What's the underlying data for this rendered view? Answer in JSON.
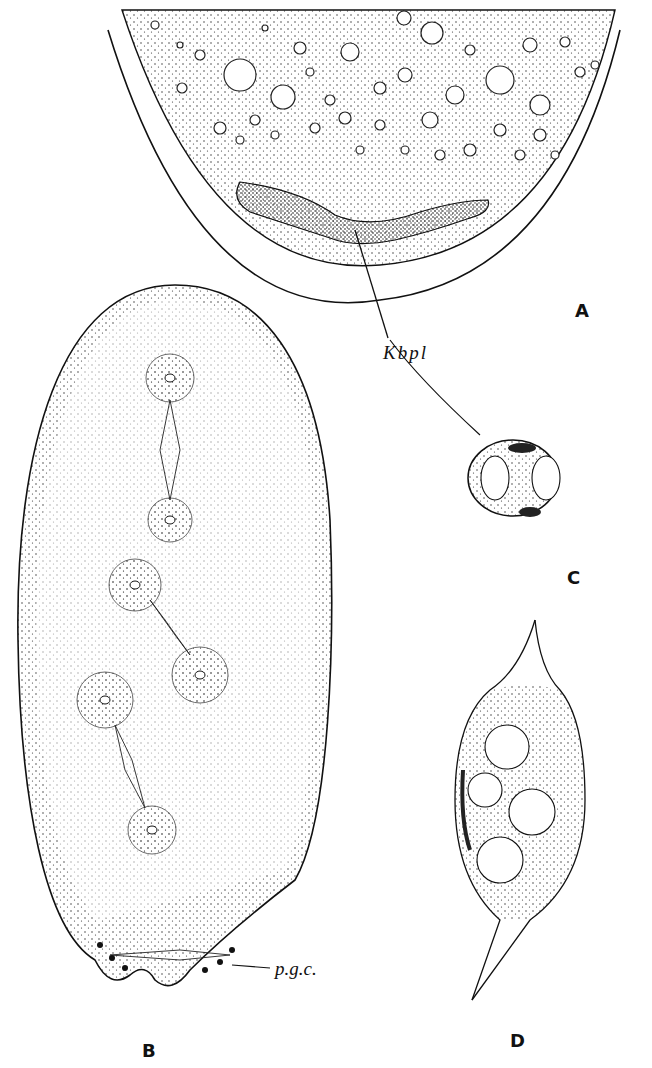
{
  "figure": {
    "panels": [
      {
        "id": "A",
        "label": "A",
        "description": "Posterior end of egg with vacuolated yolk and Keimbahn plasm"
      },
      {
        "id": "B",
        "label": "B",
        "description": "Elongated egg with cleavage nuclei and spindles; pole cells at posterior end"
      },
      {
        "id": "C",
        "label": "C",
        "description": "Pole cell with two nuclei and Keimbahn plasm granules"
      },
      {
        "id": "D",
        "label": "D",
        "description": "Spindle-shaped cluster of germ cells with nuclei"
      }
    ],
    "annotations": {
      "kbpl": "Kbpl",
      "pgc": "p.g.c."
    }
  }
}
